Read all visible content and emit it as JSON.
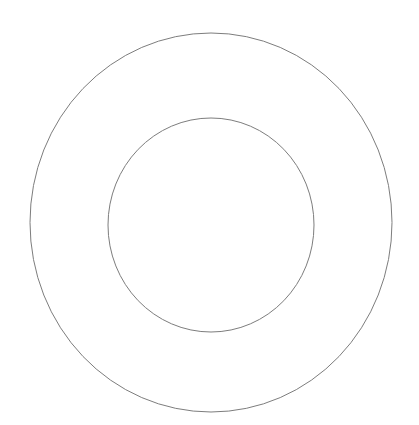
{
  "canvas": {
    "width": 419,
    "height": 425,
    "background_color": "#ffffff"
  },
  "figure": {
    "name": "concentric-circles",
    "stroke_color": "#7d7d7d",
    "fill_color": "none",
    "shape_count": 2
  },
  "chart_data": {
    "type": "scatter",
    "title": "",
    "subtitle": "",
    "xlabel": "",
    "ylabel": "",
    "grid": false,
    "legend": "none",
    "xlim": [
      0,
      419
    ],
    "ylim": [
      0,
      425
    ],
    "annotations": [],
    "tick_labels": {
      "x": [],
      "y": []
    },
    "series": [
      {
        "name": "outer-circle",
        "shape": "ellipse",
        "center_x": 211,
        "center_y": 222.5,
        "radius_x": 181,
        "radius_y": 189.5,
        "stroke": "#7d7d7d",
        "stroke_width": 1,
        "fill": "none",
        "bounds": {
          "left": 30,
          "top": 33,
          "right": 392,
          "bottom": 412
        }
      },
      {
        "name": "inner-circle",
        "shape": "ellipse",
        "center_x": 211,
        "center_y": 225,
        "radius_x": 103,
        "radius_y": 107,
        "stroke": "#7d7d7d",
        "stroke_width": 1,
        "fill": "none",
        "bounds": {
          "left": 108,
          "top": 118,
          "right": 314,
          "bottom": 332
        }
      }
    ]
  }
}
